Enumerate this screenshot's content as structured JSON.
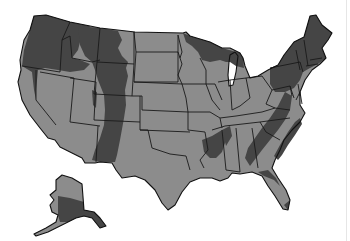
{
  "map": {
    "title": "",
    "subject": "United States map with two-tone shaded regions",
    "regions_legend": [],
    "colors": {
      "background": "#ffffff",
      "base_land": "#8c8c8c",
      "shaded_region": "#454545",
      "borders": "#1a1a1a"
    },
    "shaded_areas": [
      "Pacific Northwest (WA, OR, northern ID)",
      "Rocky Mountain band (MT, WY, CO, NM)",
      "Northern Great Lakes (northern MN, WI, MI upper)",
      "Northeast (NY, PA, New England)",
      "Appalachian band (VA, NC, TN, GA, AL)",
      "Lower Mississippi (AR, MS)",
      "Florida panhandle / northern FL",
      "Southern Alaska"
    ],
    "insets": [
      "Alaska"
    ]
  }
}
